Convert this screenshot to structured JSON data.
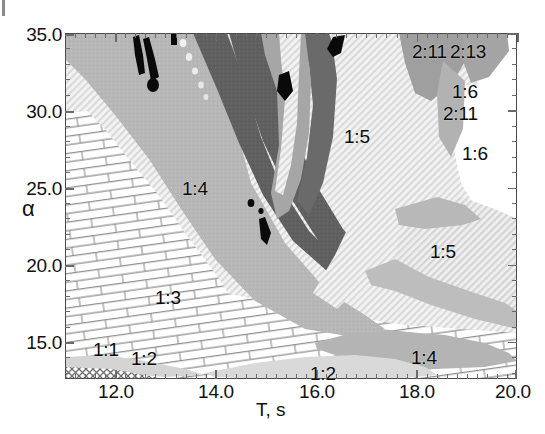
{
  "figure": {
    "background": "#ffffff",
    "frame_color": "#4a4a4a"
  },
  "axes": {
    "x": {
      "label": "T, s",
      "ticks": [
        "12.0",
        "14.0",
        "16.0",
        "18.0",
        "20.0"
      ],
      "tick_values": [
        12.0,
        14.0,
        16.0,
        18.0,
        20.0
      ],
      "range": [
        11.0,
        20.0
      ],
      "minor_ticks_per_interval": 10
    },
    "y": {
      "label": "α",
      "ticks": [
        "35.0",
        "30.0",
        "25.0",
        "20.0",
        "15.0"
      ],
      "tick_values": [
        35.0,
        30.0,
        25.0,
        20.0,
        15.0
      ],
      "range": [
        12.6,
        35.0
      ],
      "minor_ticks_per_interval": 5
    }
  },
  "region_labels": [
    {
      "text": "1:4",
      "x": 182,
      "y": 178,
      "note": "large mid-gray lobe upper-left"
    },
    {
      "text": "1:3",
      "x": 155,
      "y": 287,
      "note": "brick-hatched central-left region"
    },
    {
      "text": "1:1",
      "x": 93,
      "y": 339,
      "note": "lower-left, near 15.0"
    },
    {
      "text": "1:2",
      "x": 131,
      "y": 348,
      "note": "lower-left, below 1:1"
    },
    {
      "text": "1:2",
      "x": 310,
      "y": 363,
      "note": "bottom-center light lens"
    },
    {
      "text": "1:4",
      "x": 411,
      "y": 347,
      "note": "bottom-right mid-gray lens"
    },
    {
      "text": "1:5",
      "x": 344,
      "y": 126,
      "note": "large fine-hatch region upper-right-center"
    },
    {
      "text": "1:5",
      "x": 430,
      "y": 241,
      "note": "right-side fine-hatch region"
    },
    {
      "text": "2:11",
      "x": 412,
      "y": 41,
      "note": "top-right cluster"
    },
    {
      "text": "2:13",
      "x": 450,
      "y": 41,
      "note": "top-right cluster"
    },
    {
      "text": "1:6",
      "x": 452,
      "y": 81,
      "note": "top-right cluster"
    },
    {
      "text": "2:11",
      "x": 443,
      "y": 103,
      "note": "top-right cluster"
    },
    {
      "text": "1:6",
      "x": 462,
      "y": 143,
      "note": "right edge white region"
    }
  ],
  "chart_data": {
    "type": "heatmap",
    "title": "",
    "subtitle": "",
    "xlabel": "T, s",
    "ylabel": "α",
    "xlim": [
      11.0,
      20.0
    ],
    "ylim": [
      12.6,
      35.0
    ],
    "xticks": [
      12.0,
      14.0,
      16.0,
      18.0,
      20.0
    ],
    "yticks": [
      15.0,
      20.0,
      25.0,
      30.0,
      35.0
    ],
    "grid": false,
    "legend": "none",
    "region_classes": [
      {
        "label": "1:1",
        "fill": "#d8d8d8",
        "pattern": "solid-light-gray",
        "description": "thin sliver at lower-left above the cross-hatched corner wedge"
      },
      {
        "label": "1:2",
        "fill": "#d2d2d2",
        "pattern": "solid-light-gray",
        "description": "lower band sweeping left to right along the bottom"
      },
      {
        "label": "1:3",
        "fill": "#ffffff",
        "pattern": "brick-masonry",
        "description": "large brick-hatched field occupying the lower-left / central-lower plane"
      },
      {
        "label": "1:4",
        "fill": "#b9b9b9",
        "pattern": "solid-mid-gray",
        "description": "large mid-gray lobe from upper-left sweeping down to center; plus a lens near the bottom right"
      },
      {
        "label": "1:5",
        "fill": "#ededed",
        "pattern": "fine-diagonal-hatch",
        "description": "broad very-light diagonally hatched territory in the right half"
      },
      {
        "label": "1:6",
        "fill": "#ffffff",
        "pattern": "plain-white",
        "description": "white pockets at the far right and upper right"
      },
      {
        "label": "2:11",
        "fill": "#a9a9a9",
        "pattern": "solid-gray",
        "description": "small wedges near the top-right corner"
      },
      {
        "label": "2:13",
        "fill": "#a9a9a9",
        "pattern": "solid-gray",
        "description": "small wedge at the very top-right"
      },
      {
        "label": "chaotic-dark",
        "fill": "#5e5e5e",
        "pattern": "solid-dark-gray",
        "description": "dark curved bands crossing the upper-middle of the plane"
      },
      {
        "label": "black-filaments",
        "fill": "#000000",
        "pattern": "solid-black",
        "description": "narrow black streaks and dots embedded in the upper-middle bands"
      },
      {
        "label": "corner-wedge",
        "fill": "#ffffff",
        "pattern": "cross-hatch",
        "description": "cross-hatched wedge in the extreme lower-left corner"
      }
    ]
  }
}
